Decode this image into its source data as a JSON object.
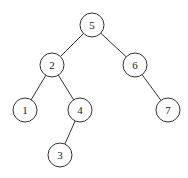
{
  "diagram": {
    "type": "binary-search-tree",
    "nodes": [
      {
        "id": "n5",
        "label": "5",
        "x": 92,
        "y": 25
      },
      {
        "id": "n2",
        "label": "2",
        "x": 52,
        "y": 65
      },
      {
        "id": "n6",
        "label": "6",
        "x": 135,
        "y": 65
      },
      {
        "id": "n1",
        "label": "1",
        "x": 25,
        "y": 110
      },
      {
        "id": "n4",
        "label": "4",
        "x": 80,
        "y": 110
      },
      {
        "id": "n7",
        "label": "7",
        "x": 168,
        "y": 110
      },
      {
        "id": "n3",
        "label": "3",
        "x": 60,
        "y": 155
      }
    ],
    "edges": [
      {
        "from": "5",
        "to": "2"
      },
      {
        "from": "5",
        "to": "6"
      },
      {
        "from": "2",
        "to": "1"
      },
      {
        "from": "2",
        "to": "4"
      },
      {
        "from": "6",
        "to": "7"
      },
      {
        "from": "4",
        "to": "3"
      }
    ]
  }
}
